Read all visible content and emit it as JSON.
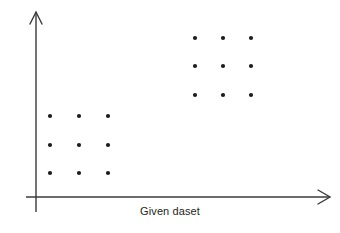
{
  "figure": {
    "background_color": "#ffffff",
    "width": 340,
    "height": 233,
    "caption": "Given daset"
  },
  "axes": {
    "color": "#3a3a3a",
    "stroke_width": 1.4,
    "origin": {
      "x": 36,
      "y": 197
    },
    "x_axis": {
      "label": "",
      "x_start": 26,
      "x_end": 330,
      "y": 197,
      "arrow": "open-v-right"
    },
    "y_axis": {
      "label": "",
      "y_start": 212,
      "y_end": 12,
      "x": 36,
      "arrow": "open-v-up"
    }
  },
  "chart_data": {
    "type": "scatter",
    "title": "",
    "subtitle": "",
    "xlabel": "Given daset",
    "ylabel": "",
    "grid": false,
    "legend": false,
    "axis_ticks": false,
    "dot_color": "#1c1c1c",
    "dot_radius": 2.1,
    "xlim": [
      26,
      330
    ],
    "ylim": [
      12,
      197
    ],
    "series": [
      {
        "name": "lower-left-cluster",
        "shape": "3x3 grid",
        "count": 9,
        "points": [
          {
            "x": 50,
            "y": 116
          },
          {
            "x": 79,
            "y": 116
          },
          {
            "x": 108,
            "y": 116
          },
          {
            "x": 50,
            "y": 145
          },
          {
            "x": 79,
            "y": 145
          },
          {
            "x": 108,
            "y": 145
          },
          {
            "x": 50,
            "y": 173
          },
          {
            "x": 79,
            "y": 173
          },
          {
            "x": 108,
            "y": 173
          }
        ]
      },
      {
        "name": "upper-right-cluster",
        "shape": "3x3 grid",
        "count": 9,
        "points": [
          {
            "x": 195,
            "y": 38
          },
          {
            "x": 223,
            "y": 38
          },
          {
            "x": 251,
            "y": 38
          },
          {
            "x": 195,
            "y": 66
          },
          {
            "x": 223,
            "y": 66
          },
          {
            "x": 251,
            "y": 66
          },
          {
            "x": 195,
            "y": 95
          },
          {
            "x": 223,
            "y": 95
          },
          {
            "x": 251,
            "y": 95
          }
        ]
      }
    ]
  },
  "caption_position": {
    "center_x": 170,
    "top": 205
  }
}
